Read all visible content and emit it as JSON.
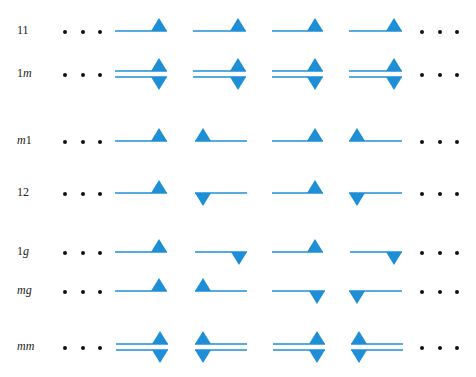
{
  "figure": {
    "motif_color": "#1e8fd6",
    "dot_color": "#111111",
    "ellipsis_symbol": "• • •",
    "rows": [
      {
        "id": "11",
        "label_parts": [
          {
            "t": "11",
            "i": false
          }
        ],
        "y": 31,
        "kind": "single",
        "motifs": [
          {
            "x0": 115,
            "x1": 167,
            "tri": [
              {
                "pos": "right",
                "dir": "up"
              }
            ]
          },
          {
            "x0": 193,
            "x1": 246,
            "tri": [
              {
                "pos": "right",
                "dir": "up"
              }
            ]
          },
          {
            "x0": 272,
            "x1": 323,
            "tri": [
              {
                "pos": "right",
                "dir": "up"
              }
            ]
          },
          {
            "x0": 349,
            "x1": 402,
            "tri": [
              {
                "pos": "right",
                "dir": "up"
              }
            ]
          }
        ]
      },
      {
        "id": "1m",
        "label_parts": [
          {
            "t": "1",
            "i": false
          },
          {
            "t": "m",
            "i": true
          }
        ],
        "y": 74,
        "kind": "double",
        "motifs": [
          {
            "x0": 115,
            "x1": 167,
            "tri": [
              {
                "pos": "right",
                "dir": "up"
              },
              {
                "pos": "right",
                "dir": "down"
              }
            ]
          },
          {
            "x0": 193,
            "x1": 246,
            "tri": [
              {
                "pos": "right",
                "dir": "up"
              },
              {
                "pos": "right",
                "dir": "down"
              }
            ]
          },
          {
            "x0": 272,
            "x1": 323,
            "tri": [
              {
                "pos": "right",
                "dir": "up"
              },
              {
                "pos": "right",
                "dir": "down"
              }
            ]
          },
          {
            "x0": 349,
            "x1": 402,
            "tri": [
              {
                "pos": "right",
                "dir": "up"
              },
              {
                "pos": "right",
                "dir": "down"
              }
            ]
          }
        ]
      },
      {
        "id": "m1",
        "label_parts": [
          {
            "t": "m",
            "i": true
          },
          {
            "t": "1",
            "i": false
          }
        ],
        "y": 141,
        "kind": "single",
        "motifs": [
          {
            "x0": 115,
            "x1": 167,
            "tri": [
              {
                "pos": "right",
                "dir": "up"
              }
            ]
          },
          {
            "x0": 195,
            "x1": 247,
            "tri": [
              {
                "pos": "left",
                "dir": "up"
              }
            ]
          },
          {
            "x0": 272,
            "x1": 323,
            "tri": [
              {
                "pos": "right",
                "dir": "up"
              }
            ]
          },
          {
            "x0": 349,
            "x1": 402,
            "tri": [
              {
                "pos": "left",
                "dir": "up"
              }
            ]
          }
        ]
      },
      {
        "id": "12",
        "label_parts": [
          {
            "t": "12",
            "i": false
          }
        ],
        "y": 193,
        "kind": "single",
        "motifs": [
          {
            "x0": 115,
            "x1": 167,
            "tri": [
              {
                "pos": "right",
                "dir": "up"
              }
            ]
          },
          {
            "x0": 195,
            "x1": 247,
            "tri": [
              {
                "pos": "left",
                "dir": "down"
              }
            ]
          },
          {
            "x0": 272,
            "x1": 323,
            "tri": [
              {
                "pos": "right",
                "dir": "up"
              }
            ]
          },
          {
            "x0": 349,
            "x1": 402,
            "tri": [
              {
                "pos": "left",
                "dir": "down"
              }
            ]
          }
        ]
      },
      {
        "id": "1g",
        "label_parts": [
          {
            "t": "1",
            "i": false
          },
          {
            "t": "g",
            "i": true
          }
        ],
        "y": 252,
        "kind": "single",
        "motifs": [
          {
            "x0": 115,
            "x1": 167,
            "tri": [
              {
                "pos": "right",
                "dir": "up"
              }
            ]
          },
          {
            "x0": 195,
            "x1": 247,
            "tri": [
              {
                "pos": "right",
                "dir": "down"
              }
            ]
          },
          {
            "x0": 272,
            "x1": 323,
            "tri": [
              {
                "pos": "right",
                "dir": "up"
              }
            ]
          },
          {
            "x0": 350,
            "x1": 402,
            "tri": [
              {
                "pos": "right",
                "dir": "down"
              }
            ]
          }
        ]
      },
      {
        "id": "mg",
        "label_parts": [
          {
            "t": "mg",
            "i": true
          }
        ],
        "y": 291,
        "kind": "single",
        "motifs": [
          {
            "x0": 115,
            "x1": 167,
            "tri": [
              {
                "pos": "right",
                "dir": "up"
              }
            ]
          },
          {
            "x0": 195,
            "x1": 247,
            "tri": [
              {
                "pos": "left",
                "dir": "up"
              }
            ]
          },
          {
            "x0": 272,
            "x1": 325,
            "tri": [
              {
                "pos": "right",
                "dir": "down"
              }
            ]
          },
          {
            "x0": 349,
            "x1": 402,
            "tri": [
              {
                "pos": "left",
                "dir": "down"
              }
            ]
          }
        ]
      },
      {
        "id": "mm",
        "label_parts": [
          {
            "t": "mm",
            "i": true
          }
        ],
        "y": 347,
        "kind": "double",
        "motifs": [
          {
            "x0": 116,
            "x1": 168,
            "tri": [
              {
                "pos": "right",
                "dir": "up"
              },
              {
                "pos": "right",
                "dir": "down"
              }
            ]
          },
          {
            "x0": 195,
            "x1": 247,
            "tri": [
              {
                "pos": "left",
                "dir": "up"
              },
              {
                "pos": "left",
                "dir": "down"
              }
            ]
          },
          {
            "x0": 273,
            "x1": 325,
            "tri": [
              {
                "pos": "right",
                "dir": "up"
              },
              {
                "pos": "right",
                "dir": "down"
              }
            ]
          },
          {
            "x0": 351,
            "x1": 403,
            "tri": [
              {
                "pos": "left",
                "dir": "up"
              },
              {
                "pos": "left",
                "dir": "down"
              }
            ]
          }
        ]
      }
    ]
  }
}
